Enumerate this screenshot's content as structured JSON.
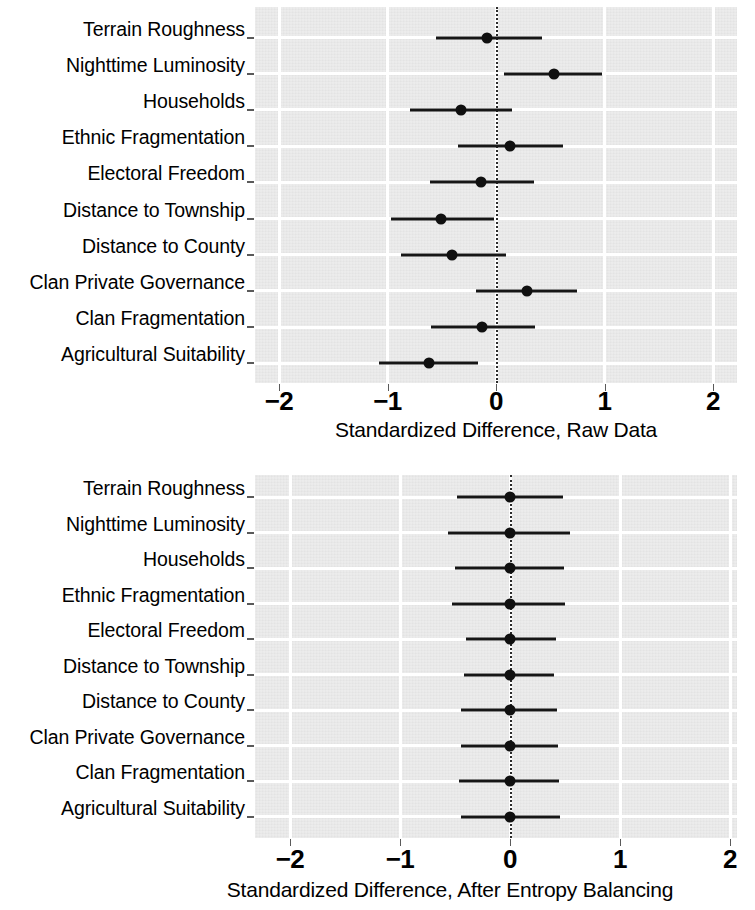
{
  "figure": {
    "type": "coefficient-plot-pair",
    "background": "#ffffff",
    "panel_fill": "#e3e3e3",
    "grid_color": "#ffffff",
    "point_color": "#101010"
  },
  "covariates": [
    "Terrain Roughness",
    "Nighttime Luminosity",
    "Households",
    "Ethnic Fragmentation",
    "Electoral Freedom",
    "Distance to Township",
    "Distance to County",
    "Clan Private Governance",
    "Clan Fragmentation",
    "Agricultural Suitability"
  ],
  "axis": {
    "ticks": [
      -2,
      -1,
      0,
      1,
      2
    ],
    "tick_labels": [
      "−2",
      "−1",
      "0",
      "1",
      "2"
    ],
    "xlim": [
      -2.22,
      2.22
    ]
  },
  "panels": [
    {
      "id": "raw-data",
      "xlabel": "Standardized Difference, Raw Data"
    },
    {
      "id": "after-entropy-balancing",
      "xlabel": "Standardized Difference, After Entropy Balancing"
    }
  ],
  "chart_data": [
    {
      "type": "scatter",
      "subtype": "dot-and-whisker",
      "title": "",
      "xlabel": "Standardized Difference, Raw Data",
      "ylabel": "",
      "xlim": [
        -2.22,
        2.22
      ],
      "xticks": [
        -2,
        -1,
        0,
        1,
        2
      ],
      "xticklabels": [
        "−2",
        "−1",
        "0",
        "1",
        "2"
      ],
      "grid": true,
      "legend": "none",
      "reference_line": 0,
      "reference_line_style": "dotted",
      "categories": [
        "Terrain Roughness",
        "Nighttime Luminosity",
        "Households",
        "Ethnic Fragmentation",
        "Electoral Freedom",
        "Distance to Township",
        "Distance to County",
        "Clan Private Governance",
        "Clan Fragmentation",
        "Agricultural Suitability"
      ],
      "values": [
        -0.08,
        0.53,
        -0.32,
        0.13,
        -0.14,
        -0.51,
        -0.41,
        0.29,
        -0.13,
        -0.62
      ],
      "ci_lower": [
        -0.55,
        0.07,
        -0.79,
        -0.35,
        -0.61,
        -0.97,
        -0.88,
        -0.18,
        -0.6,
        -1.08
      ],
      "ci_upper": [
        0.42,
        0.98,
        0.15,
        0.62,
        0.35,
        -0.02,
        0.09,
        0.75,
        0.36,
        -0.17
      ]
    },
    {
      "type": "scatter",
      "subtype": "dot-and-whisker",
      "title": "",
      "xlabel": "Standardized Difference, After Entropy Balancing",
      "ylabel": "",
      "xlim": [
        -2.22,
        2.22
      ],
      "xticks": [
        -2,
        -1,
        0,
        1,
        2
      ],
      "xticklabels": [
        "−2",
        "−1",
        "0",
        "1",
        "2"
      ],
      "grid": true,
      "legend": "none",
      "reference_line": 0,
      "reference_line_style": "dotted",
      "categories": [
        "Terrain Roughness",
        "Nighttime Luminosity",
        "Households",
        "Ethnic Fragmentation",
        "Electoral Freedom",
        "Distance to Township",
        "Distance to County",
        "Clan Private Governance",
        "Clan Fragmentation",
        "Agricultural Suitability"
      ],
      "values": [
        0.0,
        0.0,
        0.0,
        0.0,
        0.0,
        0.0,
        0.0,
        0.0,
        0.0,
        0.0
      ],
      "ci_lower": [
        -0.48,
        -0.56,
        -0.5,
        -0.53,
        -0.4,
        -0.42,
        -0.45,
        -0.45,
        -0.46,
        -0.45
      ],
      "ci_upper": [
        0.48,
        0.55,
        0.49,
        0.5,
        0.42,
        0.4,
        0.43,
        0.44,
        0.45,
        0.45
      ]
    }
  ]
}
